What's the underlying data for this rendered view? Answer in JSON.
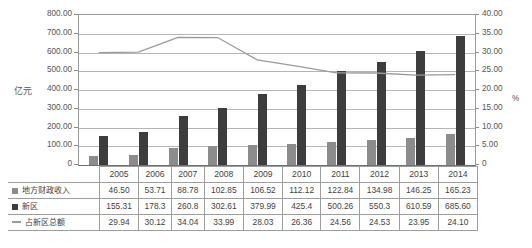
{
  "chart_data": {
    "type": "bar",
    "title": "",
    "categories": [
      "2005",
      "2006",
      "2007",
      "2008",
      "2009",
      "2010",
      "2011",
      "2012",
      "2013",
      "2014"
    ],
    "series": [
      {
        "name": "地方财政收入",
        "type": "bar",
        "axis": "left",
        "color": "#8c8c8c",
        "legend_marker": "square",
        "values": [
          46.5,
          53.71,
          88.78,
          102.85,
          106.52,
          112.12,
          122.84,
          134.98,
          146.25,
          165.23
        ],
        "labels": [
          "46.50",
          "53.71",
          "88.78",
          "102.85",
          "106.52",
          "112.12",
          "122.84",
          "134.98",
          "146.25",
          "165.23"
        ]
      },
      {
        "name": "新区",
        "type": "bar",
        "axis": "left",
        "color": "#3d3d3d",
        "legend_marker": "square",
        "values": [
          155.31,
          178.3,
          260.8,
          302.61,
          379.99,
          425.4,
          500.26,
          550.3,
          610.59,
          685.6
        ],
        "labels": [
          "155.31",
          "178.3",
          "260.8",
          "302.61",
          "379.99",
          "425.4",
          "500.26",
          "550.3",
          "610.59",
          "685.60"
        ]
      },
      {
        "name": "占新区总额",
        "type": "line",
        "axis": "right",
        "color": "#9a9a9a",
        "legend_marker": "line",
        "values": [
          29.94,
          30.12,
          34.04,
          33.99,
          28.03,
          26.36,
          24.56,
          24.53,
          23.95,
          24.1
        ],
        "labels": [
          "29.94",
          "30.12",
          "34.04",
          "33.99",
          "28.03",
          "26.36",
          "24.56",
          "24.53",
          "23.95",
          "24.10"
        ]
      }
    ],
    "xlabel": "",
    "ylabel": "亿元",
    "y2label": "%",
    "ylim": [
      0,
      800
    ],
    "ytick_step": 100,
    "y2lim": [
      0,
      40
    ],
    "y2tick_step": 5,
    "yticks": [
      "0",
      "100.00",
      "200.00",
      "300.00",
      "400.00",
      "500.00",
      "600.00",
      "700.00",
      "800.00"
    ],
    "y2ticks": [
      "0",
      "5.00",
      "10.00",
      "15.00",
      "20.00",
      "25.00",
      "30.00",
      "35.00",
      "40.00"
    ],
    "grid": true,
    "legend_position": "data-table",
    "data_table_visible": true
  },
  "axes": {
    "left_title": "亿元",
    "right_title": "%"
  },
  "table": {
    "row_headers": [
      "地方财政收入",
      "新区",
      "占新区总额"
    ],
    "header_row": [
      "2005",
      "2006",
      "2007",
      "2008",
      "2009",
      "2010",
      "2011",
      "2012",
      "2013",
      "2014"
    ],
    "rows": [
      [
        "46.50",
        "53.71",
        "88.78",
        "102.85",
        "106.52",
        "112.12",
        "122.84",
        "134.98",
        "146.25",
        "165.23"
      ],
      [
        "155.31",
        "178.3",
        "260.8",
        "302.61",
        "379.99",
        "425.4",
        "500.26",
        "550.3",
        "610.59",
        "685.60"
      ],
      [
        "29.94",
        "30.12",
        "34.04",
        "33.99",
        "28.03",
        "26.36",
        "24.56",
        "24.53",
        "23.95",
        "24.10"
      ]
    ]
  },
  "colors": {
    "series_a": "#8c8c8c",
    "series_b": "#3d3d3d",
    "series_line": "#9a9a9a",
    "grid": "#b4b4b4",
    "axis": "#8a8a8a",
    "text": "#4a4a4a"
  }
}
